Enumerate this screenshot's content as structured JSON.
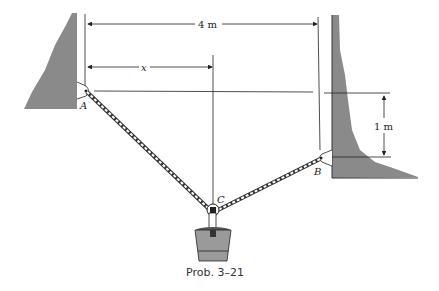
{
  "figure": {
    "caption": "Prob. 3–21",
    "labels": {
      "point_a": "A",
      "point_b": "B",
      "point_c": "C",
      "dim_x": "x"
    },
    "dimensions": {
      "horizontal_span": "4 m",
      "vertical_offset": "1 m"
    },
    "colors": {
      "wall": "#8a8a8a",
      "line": "#222222",
      "bucket": "#9a9a9a"
    }
  }
}
